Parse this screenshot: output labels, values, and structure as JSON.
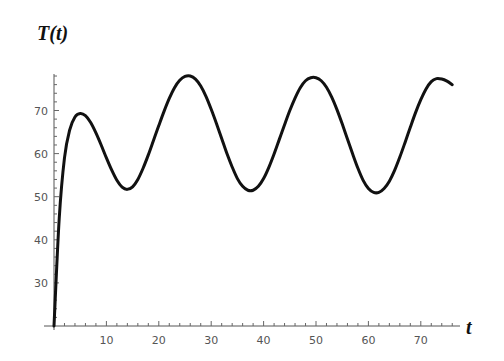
{
  "chart_data": {
    "type": "line",
    "title": "T(t)",
    "xlabel": "t",
    "ylabel": "T(t)",
    "xlim": [
      0,
      78
    ],
    "ylim": [
      20,
      78
    ],
    "x_ticks": [
      10,
      20,
      30,
      40,
      50,
      60,
      70
    ],
    "y_ticks": [
      30,
      40,
      50,
      60,
      70
    ],
    "grid": false,
    "legend": null,
    "series": [
      {
        "name": "T(t)",
        "color": "#111111",
        "x": [
          0,
          1,
          2,
          3,
          4,
          5,
          6,
          7,
          8,
          9,
          10,
          11,
          12,
          13,
          14,
          15,
          16,
          17,
          18,
          19,
          20,
          21,
          22,
          23,
          24,
          25,
          26,
          27,
          28,
          29,
          30,
          31,
          32,
          33,
          34,
          35,
          36,
          37,
          38,
          39,
          40,
          41,
          42,
          43,
          44,
          45,
          46,
          47,
          48,
          49,
          50,
          51,
          52,
          53,
          54,
          55,
          56,
          57,
          58,
          59,
          60,
          61,
          62,
          63,
          64,
          65,
          66,
          67,
          68,
          69,
          70,
          71,
          72,
          73,
          74,
          75,
          76
        ],
        "y": [
          20,
          45,
          59,
          65.5,
          68.5,
          69.3,
          68.8,
          67.2,
          64.8,
          62,
          59,
          56.2,
          53.8,
          52.2,
          51.7,
          52.3,
          54,
          56.6,
          59.7,
          63.1,
          66.5,
          69.8,
          72.8,
          75.3,
          77,
          77.9,
          78,
          77.3,
          75.7,
          73.3,
          70.3,
          67,
          63.5,
          60,
          56.9,
          54.2,
          52.4,
          51.5,
          51.5,
          52.4,
          54.2,
          56.8,
          59.9,
          63.3,
          66.7,
          70,
          72.9,
          75.3,
          76.9,
          77.6,
          77.6,
          76.9,
          75.4,
          73.1,
          70.2,
          66.9,
          63.4,
          59.9,
          56.6,
          53.8,
          51.9,
          51,
          51,
          51.9,
          53.6,
          56.1,
          59.2,
          62.6,
          66.1,
          69.5,
          72.5,
          75,
          76.7,
          77.4,
          77.3,
          76.8,
          76
        ]
      }
    ]
  }
}
